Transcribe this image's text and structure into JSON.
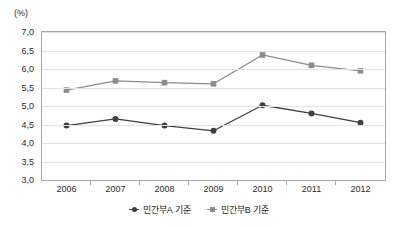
{
  "chart_data": {
    "type": "line",
    "title": "",
    "subtitle": "",
    "unit_label": "(%)",
    "xlabel": "",
    "ylabel": "",
    "categories": [
      "2006",
      "2007",
      "2008",
      "2009",
      "2010",
      "2011",
      "2012"
    ],
    "ylim": [
      3.0,
      7.0
    ],
    "ytick_step": 0.5,
    "ytick_labels": [
      "7,0",
      "6,5",
      "6,0",
      "5,5",
      "5,0",
      "4,5",
      "4,0",
      "3,5",
      "3,0"
    ],
    "ytick_values": [
      7.0,
      6.5,
      6.0,
      5.5,
      5.0,
      4.5,
      4.0,
      3.5,
      3.0
    ],
    "decimal_separator": ",",
    "grid": true,
    "grid_axis": "y",
    "legend_position": "bottom",
    "series": [
      {
        "name": "민간부A 기준",
        "marker": "circle",
        "color": "#3f3f3f",
        "values": [
          4.47,
          4.65,
          4.47,
          4.33,
          5.02,
          4.8,
          4.55
        ]
      },
      {
        "name": "민간부B 기준",
        "marker": "square",
        "color": "#8c8c8c",
        "values": [
          5.43,
          5.68,
          5.63,
          5.6,
          6.38,
          6.1,
          5.95
        ]
      }
    ]
  },
  "legend": {
    "items": [
      {
        "label": "민간부A 기준"
      },
      {
        "label": "민간부B 기준"
      }
    ]
  },
  "colors": {
    "series_a": "#3f3f3f",
    "series_b": "#8c8c8c",
    "grid": "#e2e2e2",
    "frame": "#a6a6a6",
    "text": "#2b2b2b",
    "background": "#ffffff"
  }
}
